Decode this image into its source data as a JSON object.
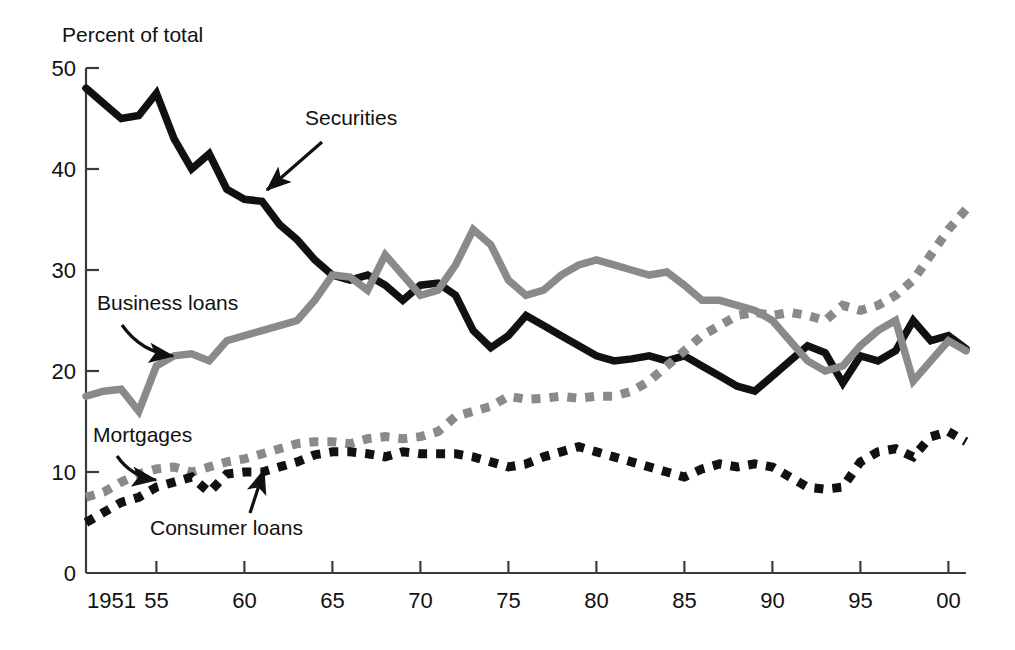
{
  "chart_data": {
    "type": "line",
    "title": "",
    "subtitle": "",
    "ylabel": "Percent of total",
    "xlabel": "",
    "xlim": [
      1951,
      2001
    ],
    "ylim": [
      0,
      50
    ],
    "grid": false,
    "legend_position": "inline-annotations",
    "y_ticks": [
      "0",
      "10",
      "20",
      "30",
      "40",
      "50"
    ],
    "y_tick_values": [
      0,
      10,
      20,
      30,
      40,
      50
    ],
    "x_ticks": [
      "1951",
      "55",
      "60",
      "65",
      "70",
      "75",
      "80",
      "85",
      "90",
      "95",
      "00"
    ],
    "x_tick_values": [
      1951,
      1955,
      1960,
      1965,
      1970,
      1975,
      1980,
      1985,
      1990,
      1995,
      2000
    ],
    "x": [
      1951,
      1952,
      1953,
      1954,
      1955,
      1956,
      1957,
      1958,
      1959,
      1960,
      1961,
      1962,
      1963,
      1964,
      1965,
      1966,
      1967,
      1968,
      1969,
      1970,
      1971,
      1972,
      1973,
      1974,
      1975,
      1976,
      1977,
      1978,
      1979,
      1980,
      1981,
      1982,
      1983,
      1984,
      1985,
      1986,
      1987,
      1988,
      1989,
      1990,
      1991,
      1992,
      1993,
      1994,
      1995,
      1996,
      1997,
      1998,
      1999,
      2000,
      2001
    ],
    "series": [
      {
        "name": "Securities",
        "color": "#111111",
        "style": "solid",
        "values": [
          48.0,
          46.5,
          45.0,
          45.3,
          47.5,
          43.0,
          40.0,
          41.5,
          38.0,
          37.0,
          36.8,
          34.5,
          33.0,
          31.0,
          29.5,
          29.0,
          29.5,
          28.5,
          27.0,
          28.5,
          28.7,
          27.5,
          24.0,
          22.3,
          23.5,
          25.5,
          24.5,
          23.5,
          22.5,
          21.5,
          21.0,
          21.2,
          21.5,
          21.0,
          21.5,
          20.5,
          19.5,
          18.5,
          18.0,
          19.5,
          21.0,
          22.5,
          21.8,
          18.8,
          21.5,
          21.0,
          22.0,
          25.0,
          23.0,
          23.5,
          22.2
        ]
      },
      {
        "name": "Business loans",
        "color": "#8a8a8a",
        "style": "solid",
        "values": [
          17.5,
          18.0,
          18.2,
          16.0,
          20.5,
          21.5,
          21.7,
          21.0,
          23.0,
          23.5,
          24.0,
          24.5,
          25.0,
          27.0,
          29.5,
          29.3,
          28.0,
          31.5,
          29.5,
          27.5,
          28.0,
          30.5,
          34.0,
          32.5,
          29.0,
          27.5,
          28.0,
          29.5,
          30.5,
          31.0,
          30.5,
          30.0,
          29.5,
          29.8,
          28.5,
          27.0,
          27.0,
          26.5,
          26.0,
          25.0,
          23.0,
          21.0,
          20.0,
          20.5,
          22.5,
          24.0,
          25.0,
          19.0,
          21.0,
          23.0,
          22.0
        ]
      },
      {
        "name": "Mortgages",
        "color": "#8a8a8a",
        "style": "dashed",
        "values": [
          7.5,
          8.0,
          9.0,
          9.8,
          10.3,
          10.5,
          10.0,
          10.5,
          11.0,
          11.3,
          11.8,
          12.3,
          12.8,
          13.0,
          13.0,
          12.8,
          13.3,
          13.5,
          13.3,
          13.5,
          14.0,
          15.5,
          16.0,
          16.5,
          17.5,
          17.2,
          17.3,
          17.5,
          17.3,
          17.5,
          17.5,
          18.0,
          19.0,
          20.5,
          22.0,
          23.5,
          24.5,
          25.5,
          25.8,
          25.5,
          25.8,
          25.5,
          25.0,
          26.5,
          26.0,
          26.5,
          27.5,
          29.0,
          31.5,
          34.0,
          36.0
        ]
      },
      {
        "name": "Consumer loans",
        "color": "#111111",
        "style": "dashed",
        "values": [
          5.0,
          6.0,
          7.0,
          7.5,
          8.5,
          9.0,
          9.5,
          8.0,
          9.8,
          10.0,
          10.0,
          10.5,
          11.0,
          11.7,
          12.0,
          12.0,
          11.8,
          11.5,
          12.0,
          11.8,
          11.8,
          11.8,
          11.5,
          11.0,
          10.5,
          10.8,
          11.5,
          12.0,
          12.5,
          12.0,
          11.5,
          11.0,
          10.5,
          10.0,
          9.5,
          10.3,
          10.8,
          10.5,
          10.8,
          10.5,
          9.5,
          8.5,
          8.3,
          8.5,
          11.0,
          12.0,
          12.3,
          11.5,
          13.5,
          14.0,
          13.0
        ]
      }
    ],
    "annotations": [
      {
        "name": "securities",
        "label": "Securities",
        "label_x": 305,
        "label_y": 125,
        "arrow_from_x": 322,
        "arrow_from_y": 142,
        "arrow_to_x": 267,
        "arrow_to_y": 190
      },
      {
        "name": "business-loans",
        "label": "Business loans",
        "label_x": 97,
        "label_y": 310,
        "arrow_from_x": 122,
        "arrow_from_y": 325,
        "arrow_to_x": 173,
        "arrow_to_y": 356
      },
      {
        "name": "mortgages",
        "label": "Mortgages",
        "label_x": 93,
        "label_y": 442,
        "arrow_from_x": 117,
        "arrow_from_y": 456,
        "arrow_to_x": 156,
        "arrow_to_y": 480
      },
      {
        "name": "consumer-loans",
        "label": "Consumer loans",
        "label_x": 150,
        "label_y": 535,
        "arrow_from_x": 250,
        "arrow_from_y": 513,
        "arrow_to_x": 264,
        "arrow_to_y": 470
      }
    ]
  },
  "figure": {
    "axis_label": "Percent of total",
    "axis_color": "#3b3b3b",
    "background": "#ffffff"
  }
}
